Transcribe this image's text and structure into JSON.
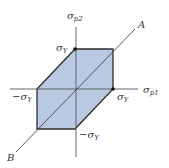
{
  "diagram": {
    "colors": {
      "fill": "#b9c9e1",
      "stroke": "#2e2e2e",
      "axis": "#555555"
    },
    "axes": {
      "horizontal": {
        "symbol": "σ",
        "subscript": "p1"
      },
      "vertical": {
        "symbol": "σ",
        "subscript": "p2"
      }
    },
    "labels": {
      "top_yield": {
        "symbol": "σ",
        "subscript": "Y"
      },
      "right_yield": {
        "symbol": "σ",
        "subscript": "Y"
      },
      "left_yield": {
        "prefix": "−",
        "symbol": "σ",
        "subscript": "Y"
      },
      "bottom_yield": {
        "prefix": "−",
        "symbol": "σ",
        "subscript": "Y"
      },
      "line_a": "A",
      "line_b": "B"
    },
    "hexagon_points": "37,89 75,49 113,49 113,89 75,129 37,129"
  }
}
